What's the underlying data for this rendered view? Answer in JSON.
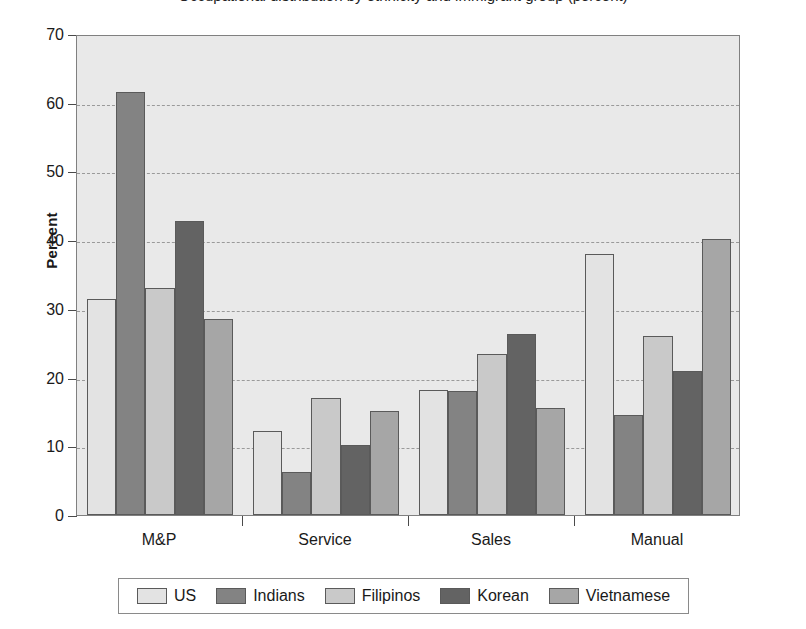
{
  "chart_data": {
    "type": "bar",
    "title": "Occupational distribution by ethnicity and immigrant group (percent)",
    "xlabel": "",
    "ylabel": "Percent",
    "ylim": [
      0,
      70
    ],
    "ytick_step": 10,
    "yticks": [
      "70",
      "60",
      "50",
      "40",
      "30",
      "20",
      "10",
      "0"
    ],
    "grid": true,
    "legend_position": "bottom",
    "categories": [
      "M&P",
      "Service",
      "Sales",
      "Manual"
    ],
    "series": [
      {
        "name": "US",
        "color": "#e3e3e3",
        "values": [
          31.5,
          12.2,
          18.2,
          38.0
        ]
      },
      {
        "name": "Indians",
        "color": "#838383",
        "values": [
          61.5,
          6.2,
          18.1,
          14.5
        ]
      },
      {
        "name": "Filipinos",
        "color": "#c9c9c9",
        "values": [
          33.1,
          17.1,
          23.4,
          26.0
        ]
      },
      {
        "name": "Korean",
        "color": "#636363",
        "values": [
          42.8,
          10.2,
          26.3,
          20.9
        ]
      },
      {
        "name": "Vietnamese",
        "color": "#a6a6a6",
        "values": [
          28.5,
          15.2,
          15.6,
          40.2
        ]
      }
    ]
  },
  "style": {
    "plot_background": "#e9e9e9",
    "frame_color": "#808080",
    "gridline_color": "#9a9a9a",
    "bar_edge_color": "#5a5a5a",
    "legend_background": "#ffffff",
    "text_color": "#1a1a1a"
  }
}
